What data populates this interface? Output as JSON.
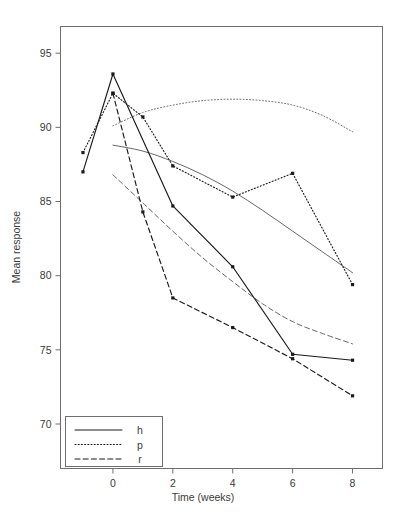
{
  "chart_data": {
    "type": "line",
    "title": "",
    "subtitle": "",
    "xlabel": "Time (weeks)",
    "ylabel": "Mean response",
    "xlim": [
      -1.75,
      9.0
    ],
    "ylim": [
      67.0,
      96.8
    ],
    "xticks": [
      0,
      2,
      4,
      6,
      8
    ],
    "xtick_labels": [
      "0",
      "2",
      "4",
      "6",
      "8"
    ],
    "yticks": [
      70,
      75,
      80,
      85,
      90,
      95
    ],
    "ytick_labels": [
      "70",
      "75",
      "80",
      "85",
      "90",
      "95"
    ],
    "grid": false,
    "legend_position": "bottom-left",
    "legend": [
      {
        "label": "h",
        "style": "solid"
      },
      {
        "label": "p",
        "style": "dotted"
      },
      {
        "label": "r",
        "style": "dashed"
      }
    ],
    "series": [
      {
        "name": "h",
        "style": "solid",
        "x": [
          -1,
          0,
          2,
          4,
          6,
          8
        ],
        "values": [
          87.0,
          93.6,
          84.7,
          80.6,
          74.7,
          74.3
        ]
      },
      {
        "name": "p",
        "style": "dotted",
        "x": [
          -1,
          0,
          1,
          2,
          4,
          6,
          8
        ],
        "values": [
          88.3,
          92.3,
          90.7,
          87.4,
          85.3,
          86.9,
          79.4
        ]
      },
      {
        "name": "r",
        "style": "dashed",
        "x": [
          0,
          1,
          2,
          4,
          6,
          8
        ],
        "values": [
          92.3,
          84.3,
          78.5,
          76.5,
          74.4,
          71.9
        ]
      }
    ],
    "fitted_curves": [
      {
        "name": "h-fit",
        "style": "solid",
        "x": [
          0,
          1,
          2,
          3,
          4,
          5,
          6,
          7,
          8
        ],
        "values": [
          88.8,
          88.4,
          87.7,
          86.8,
          85.7,
          84.4,
          83.0,
          81.6,
          80.2
        ]
      },
      {
        "name": "p-fit",
        "style": "dotted",
        "x": [
          0,
          1,
          2,
          3,
          4,
          5,
          6,
          7,
          8
        ],
        "values": [
          90.1,
          91.0,
          91.5,
          91.8,
          91.9,
          91.8,
          91.5,
          90.8,
          89.7
        ]
      },
      {
        "name": "r-fit",
        "style": "dashed",
        "x": [
          0,
          1,
          2,
          3,
          4,
          5,
          6,
          7,
          8
        ],
        "values": [
          86.8,
          84.9,
          83.0,
          81.2,
          79.6,
          78.1,
          76.9,
          76.1,
          75.4
        ]
      }
    ]
  }
}
